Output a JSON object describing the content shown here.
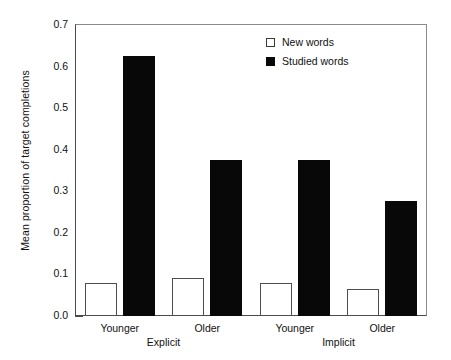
{
  "chart_data": {
    "type": "bar",
    "title": "",
    "xlabel": "",
    "ylabel": "Mean proportion of target completions",
    "ylim": [
      0.0,
      0.7
    ],
    "ytick_labels": [
      "0.0",
      "0.1",
      "0.2",
      "0.3",
      "0.4",
      "0.5",
      "0.6",
      "0.7"
    ],
    "ytick_values": [
      0.0,
      0.1,
      0.2,
      0.3,
      0.4,
      0.5,
      0.6,
      0.7
    ],
    "grid": false,
    "legend_position": "top-right",
    "categories": [
      "Younger",
      "Older",
      "Younger",
      "Older"
    ],
    "group_labels": [
      "Explicit",
      "Implicit"
    ],
    "series": [
      {
        "name": "New words",
        "color": "#ffffff",
        "edge": "#4d4d4d",
        "values": [
          0.08,
          0.091,
          0.08,
          0.066
        ]
      },
      {
        "name": "Studied words",
        "color": "#080808",
        "edge": "#080808",
        "values": [
          0.625,
          0.375,
          0.375,
          0.277
        ]
      }
    ]
  },
  "legend": {
    "items": [
      {
        "label": "New words",
        "swatch": "open-square"
      },
      {
        "label": "Studied words",
        "swatch": "filled-square"
      }
    ]
  },
  "axes": {
    "y_title": "Mean proportion of target completions"
  }
}
